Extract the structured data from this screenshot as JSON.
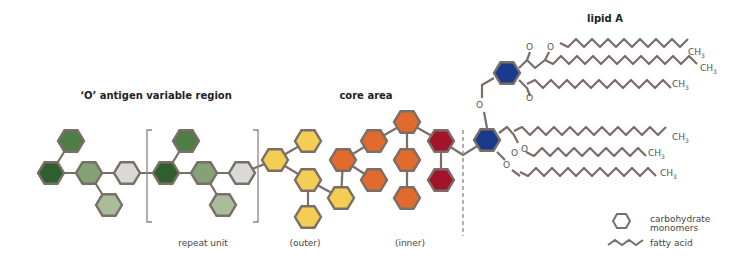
{
  "labels": {
    "o_antigen": "‘O’ antigen variable region",
    "core_area": "core area",
    "lipid_a": "lipid A",
    "repeat_unit": "repeat unit",
    "outer": "(outer)",
    "inner": "(inner)"
  },
  "legend": {
    "carbohydrate_line1": "carbohydrate",
    "carbohydrate_line2": "monomers",
    "fatty_acid": "fatty acid"
  },
  "chem": {
    "oxygen": "O",
    "methyl": "CH",
    "methyl_sub": "3"
  },
  "colors": {
    "hex_border": "#7a6e68",
    "bond": "#7a6e68",
    "green_dark": "#2f5e2f",
    "green_mid": "#4e7d45",
    "green_light": "#84a275",
    "green_pale": "#a9bd9a",
    "grey_pale": "#d8dad6",
    "yellow": "#f4cd54",
    "orange": "#e26a2c",
    "red": "#a3142a",
    "blue": "#1a3a8c"
  },
  "monomers": [
    {
      "group": "o-antigen",
      "color": "green_mid"
    },
    {
      "group": "o-antigen",
      "color": "green_dark"
    },
    {
      "group": "o-antigen",
      "color": "green_light"
    },
    {
      "group": "o-antigen",
      "color": "grey_pale"
    },
    {
      "group": "o-antigen",
      "color": "green_pale"
    },
    {
      "group": "repeat-unit",
      "color": "green_mid"
    },
    {
      "group": "repeat-unit",
      "color": "green_dark"
    },
    {
      "group": "repeat-unit",
      "color": "green_light"
    },
    {
      "group": "repeat-unit",
      "color": "grey_pale"
    },
    {
      "group": "repeat-unit",
      "color": "green_pale"
    },
    {
      "group": "core-outer",
      "color": "yellow"
    },
    {
      "group": "core-outer",
      "color": "yellow"
    },
    {
      "group": "core-outer",
      "color": "yellow"
    },
    {
      "group": "core-outer",
      "color": "yellow"
    },
    {
      "group": "core-outer",
      "color": "yellow"
    },
    {
      "group": "core-inner",
      "color": "orange"
    },
    {
      "group": "core-inner",
      "color": "orange"
    },
    {
      "group": "core-inner",
      "color": "orange"
    },
    {
      "group": "core-inner",
      "color": "orange"
    },
    {
      "group": "core-inner",
      "color": "orange"
    },
    {
      "group": "core-inner",
      "color": "orange"
    },
    {
      "group": "core-inner",
      "color": "red"
    },
    {
      "group": "core-inner",
      "color": "red"
    },
    {
      "group": "lipid-a",
      "color": "blue"
    },
    {
      "group": "lipid-a",
      "color": "blue"
    }
  ]
}
